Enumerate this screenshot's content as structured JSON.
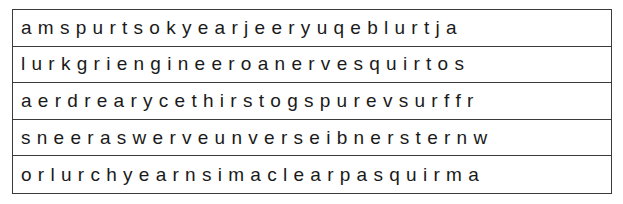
{
  "puzzle": {
    "rows": [
      "a m s p u r t s o k y e a r j e e r y u q e b l u r t j a",
      "l u r k g r i e n g i n e e r o a n e r v e s q u i r t o s",
      "a e r d r e a r y c e t h i r s t o g s p u r e v s u r f f r",
      "s n e e r a s w e r v e u n v e r s e i b n e r s t e r n w",
      "o r l u r c h y e a r n s i m a c l e a r p a s q u i r m a"
    ]
  }
}
